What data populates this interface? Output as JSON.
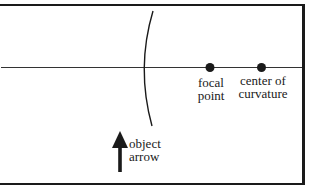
{
  "diagram": {
    "type": "concave-mirror-ray-diagram",
    "elements": {
      "principal_axis": {
        "label": ""
      },
      "mirror": {
        "label": ""
      },
      "focal_point": {
        "line1": "focal",
        "line2": "point"
      },
      "center_of_curvature": {
        "line1": "center of",
        "line2": "curvature"
      },
      "object_arrow": {
        "line1": "object",
        "line2": "arrow"
      }
    },
    "colors": {
      "ink": "#1a1a1a",
      "background": "#ffffff"
    }
  }
}
